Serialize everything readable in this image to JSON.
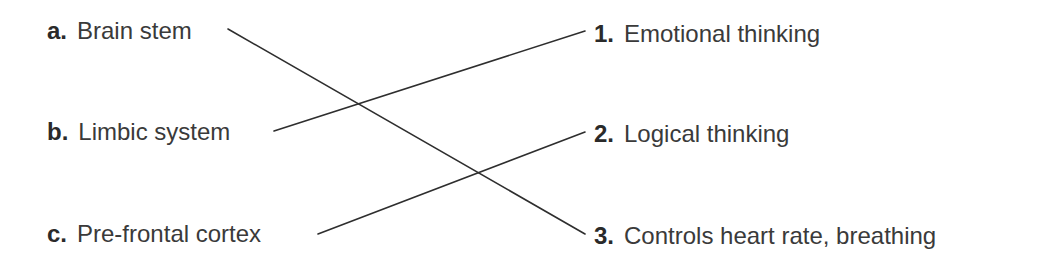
{
  "left_items": [
    {
      "marker": "a.",
      "label": "Brain stem"
    },
    {
      "marker": "b.",
      "label": "Limbic system"
    },
    {
      "marker": "c.",
      "label": "Pre-frontal cortex"
    }
  ],
  "right_items": [
    {
      "marker": "1.",
      "label": "Emotional thinking"
    },
    {
      "marker": "2.",
      "label": "Logical thinking"
    },
    {
      "marker": "3.",
      "label": "Controls heart rate, breathing"
    }
  ],
  "connections": [
    {
      "from": "a",
      "to": "3"
    },
    {
      "from": "b",
      "to": "1"
    },
    {
      "from": "c",
      "to": "2"
    }
  ],
  "colors": {
    "text": "#3a3a3a",
    "line": "#2e2e2e"
  }
}
